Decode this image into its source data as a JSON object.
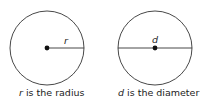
{
  "figures": [
    {
      "variable": "r",
      "caption_rest": " is the radius",
      "segment": "radius"
    },
    {
      "variable": "d",
      "caption_rest": " is the diameter",
      "segment": "diameter"
    }
  ],
  "colors": {
    "stroke": "#333333",
    "dot": "#111111",
    "text": "#222222"
  }
}
